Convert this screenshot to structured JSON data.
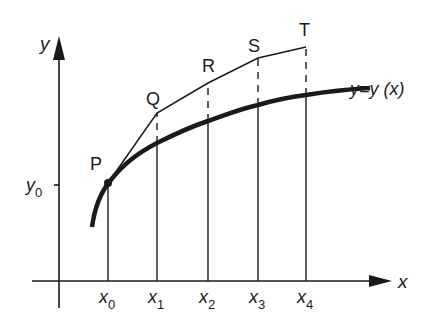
{
  "diagram": {
    "axes": {
      "x_label": "x",
      "y_label": "y",
      "y0_label": "y",
      "y0_sub": "0"
    },
    "curve_label": "y=y (x)",
    "ticks": [
      {
        "base": "x",
        "sub": "0"
      },
      {
        "base": "x",
        "sub": "1"
      },
      {
        "base": "x",
        "sub": "2"
      },
      {
        "base": "x",
        "sub": "3"
      },
      {
        "base": "x",
        "sub": "4"
      }
    ],
    "points": [
      {
        "label": "P"
      },
      {
        "label": "Q"
      },
      {
        "label": "R"
      },
      {
        "label": "S"
      },
      {
        "label": "T"
      }
    ],
    "colors": {
      "ink": "#1a1a1a",
      "background": "#ffffff"
    }
  }
}
